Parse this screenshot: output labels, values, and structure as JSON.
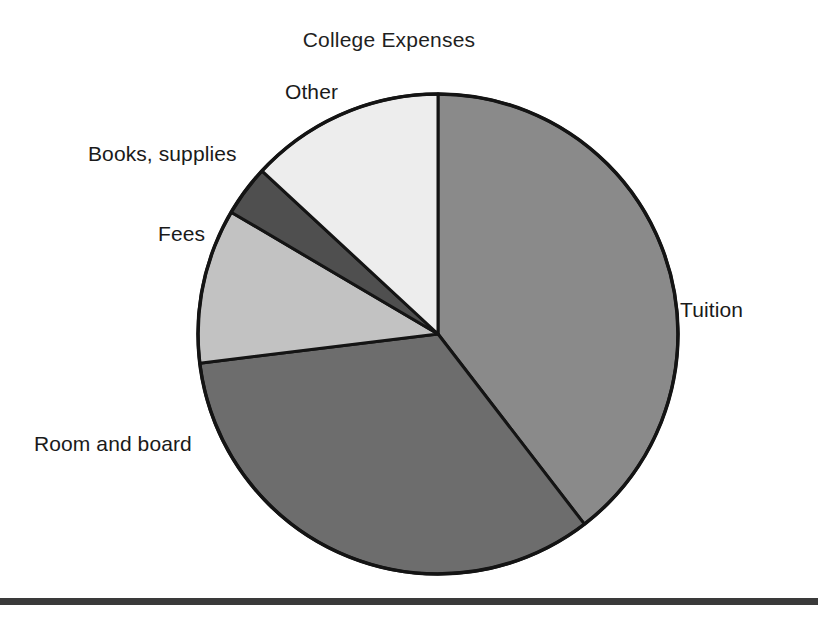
{
  "chart_data": {
    "type": "pie",
    "title": "College Expenses",
    "xlabel": "",
    "ylabel": "",
    "legend_position": "outside-labels",
    "grid": false,
    "categories": [
      "Tuition",
      "Room and board",
      "Fees",
      "Books, supplies",
      "Other"
    ],
    "values": [
      39.5,
      33.6,
      10.3,
      3.4,
      13.2
    ],
    "units": "percent",
    "start_angle_deg": 0,
    "direction": "clockwise",
    "slices": [
      {
        "label": "Tuition",
        "value": 39.5,
        "start_angle_deg": 0,
        "end_angle_deg": 142.4,
        "sweep_deg": 142.4,
        "color": "#8a8a8a"
      },
      {
        "label": "Room and board",
        "value": 33.6,
        "start_angle_deg": 142.4,
        "end_angle_deg": 263.0,
        "sweep_deg": 120.6,
        "color": "#6d6d6d"
      },
      {
        "label": "Fees",
        "value": 10.3,
        "start_angle_deg": 263.0,
        "end_angle_deg": 300.5,
        "sweep_deg": 37.5,
        "color": "#c2c2c2"
      },
      {
        "label": "Books, supplies",
        "value": 3.4,
        "start_angle_deg": 300.5,
        "end_angle_deg": 312.8,
        "sweep_deg": 12.3,
        "color": "#4f4f4f"
      },
      {
        "label": "Other",
        "value": 13.2,
        "start_angle_deg": 312.8,
        "end_angle_deg": 360.0,
        "sweep_deg": 47.2,
        "color": "#ededed"
      }
    ]
  },
  "labels": {
    "title": "College Expenses",
    "other": "Other",
    "books_supplies": "Books, supplies",
    "fees": "Fees",
    "room_and_board": "Room and board",
    "tuition": "Tuition"
  },
  "colors": {
    "tuition": "#8a8a8a",
    "room_and_board": "#6d6d6d",
    "fees": "#c2c2c2",
    "books_supplies": "#4f4f4f",
    "other": "#ededed",
    "outline": "#141414",
    "text": "#1a1a1a",
    "rule": "#3a3a3a",
    "background": "#ffffff"
  }
}
